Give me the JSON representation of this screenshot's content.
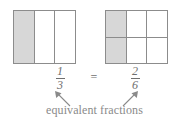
{
  "figure": {
    "caption": "equivalent fractions",
    "equals_symbol": "=",
    "colors": {
      "shade": "#d7d7d7",
      "stroke": "#8c8c8c",
      "text": "#7a7a7a",
      "background": "#ffffff"
    }
  },
  "models": [
    {
      "name": "one-third",
      "columns": 3,
      "rows": 1,
      "shaded_cells": 1,
      "total_cells": 3,
      "fraction": {
        "numerator": "1",
        "denominator": "3"
      }
    },
    {
      "name": "two-sixths",
      "columns": 3,
      "rows": 2,
      "shaded_cells": 2,
      "total_cells": 6,
      "fraction": {
        "numerator": "2",
        "denominator": "6"
      }
    }
  ],
  "annotations": {
    "arrow_left": "arrow-up-left",
    "arrow_right": "arrow-up-right"
  }
}
